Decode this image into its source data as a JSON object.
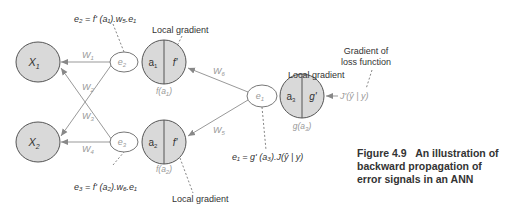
{
  "diagram": {
    "title": "Backward propagation of error signals",
    "nodes": {
      "x1": {
        "label": "X",
        "sub": "1"
      },
      "x2": {
        "label": "X",
        "sub": "2"
      },
      "e2": {
        "label": "e",
        "sub": "2"
      },
      "e3": {
        "label": "e",
        "sub": "3"
      },
      "e1": {
        "label": "e",
        "sub": "1"
      },
      "n1": {
        "left": "a",
        "left_sub": "1",
        "right": "f'",
        "below": "f(a",
        "below_sub": "1",
        "below_end": ")"
      },
      "n2": {
        "left": "a",
        "left_sub": "2",
        "right": "f'",
        "below": "f(a",
        "below_sub": "2",
        "below_end": ")"
      },
      "n3": {
        "left": "a",
        "left_sub": "3",
        "right": "g'",
        "below": "g(a",
        "below_sub": "3",
        "below_end": ")"
      }
    },
    "weights": {
      "w1": {
        "label": "W",
        "sub": "1"
      },
      "w2": {
        "label": "W",
        "sub": "2"
      },
      "w3": {
        "label": "W",
        "sub": "3"
      },
      "w4": {
        "label": "W",
        "sub": "4"
      },
      "w5": {
        "label": "W",
        "sub": "5"
      },
      "w6": {
        "label": "W",
        "sub": "6"
      }
    },
    "equations": {
      "e2": "e₂ = f' (a₁).w₅.e₁",
      "e3": "e₃ = f' (a₂).w₆.e₁",
      "e1": "e₁ = g' (a₃).J(ŷ | y)"
    },
    "annotations": {
      "local_gradient_1": "Local gradient",
      "local_gradient_2": "Local gradient",
      "local_gradient_3": "Local gradient",
      "gradient_of_loss_line1": "Gradient of",
      "gradient_of_loss_line2": "loss function",
      "loss_input": "J'(ŷ | y)"
    },
    "colors": {
      "node_fill": "#d9d9d9",
      "node_stroke": "#555555",
      "error_node_fill": "#ffffff",
      "edge": "#999999",
      "text": "#333333",
      "muted_text": "#999999"
    }
  },
  "caption": {
    "number": "Figure 4.9",
    "text": "An illustration of backward propagation of error signals in an ANN"
  }
}
